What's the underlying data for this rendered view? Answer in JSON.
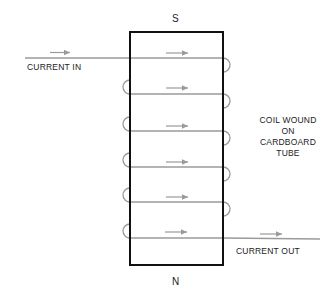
{
  "diagram": {
    "type": "solenoid-coil",
    "poles": {
      "top": "S",
      "bottom": "N"
    },
    "labels": {
      "current_in": "CURRENT IN",
      "current_out": "CURRENT OUT",
      "coil_note": [
        "COIL WOUND",
        "ON",
        "CARDBOARD",
        "TUBE"
      ]
    },
    "colors": {
      "tube_outline": "#111111",
      "wire": "#9a9a9a",
      "arrow": "#9a9a9a",
      "text": "#222222"
    },
    "turns": 6,
    "current_direction": "left-to-right"
  }
}
